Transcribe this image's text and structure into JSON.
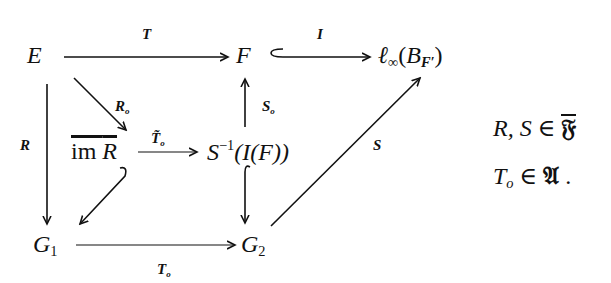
{
  "diagram": {
    "type": "commutative-diagram",
    "nodes": {
      "E": "E",
      "F": "F",
      "linf": "ℓ",
      "linf_sub": "∞",
      "linf_arg_open": "(",
      "linf_B": "B",
      "linf_B_sub": "F′",
      "linf_arg_close": ")",
      "imR_prefix": "im ",
      "imR_R": "R",
      "Sinv_S": "S",
      "Sinv_sup": "−1",
      "Sinv_rest": "(I(F))",
      "G1": "G",
      "G1_sub": "1",
      "G2": "G",
      "G2_sub": "2"
    },
    "arrows": [
      {
        "from": "E",
        "to": "F",
        "label": "T",
        "style": "arrow"
      },
      {
        "from": "F",
        "to": "ℓ∞(B_F′)",
        "label": "I",
        "style": "hook-arrow"
      },
      {
        "from": "E",
        "to": "G1",
        "label": "R",
        "style": "arrow"
      },
      {
        "from": "E",
        "to": "im R",
        "label": "R_o",
        "style": "arrow"
      },
      {
        "from": "im R",
        "to": "S⁻¹(I(F))",
        "label": "T̃_o",
        "style": "arrow"
      },
      {
        "from": "im R",
        "to": "G1",
        "label": "",
        "style": "hook-arrow"
      },
      {
        "from": "S⁻¹(I(F))",
        "to": "F",
        "label": "S_o",
        "style": "arrow"
      },
      {
        "from": "S⁻¹(I(F))",
        "to": "G2",
        "label": "",
        "style": "hook-arrow"
      },
      {
        "from": "G1",
        "to": "G2",
        "label": "T_o",
        "style": "arrow"
      },
      {
        "from": "G2",
        "to": "ℓ∞(B_F′)",
        "label": "S",
        "style": "arrow"
      }
    ],
    "labels": {
      "T": "T",
      "I": "I",
      "R": "R",
      "Ro": "R",
      "Ro_sub": "o",
      "Tto": "T̃",
      "Tto_sub": "o",
      "So": "S",
      "So_sub": "o",
      "To": "T",
      "To_sub": "o",
      "S": "S"
    }
  },
  "side_conditions": {
    "line1_vars": "R, S",
    "line1_rel": " ∈ ",
    "line1_set": "𝔉",
    "line2_var": "T",
    "line2_var_sub": "o",
    "line2_rel": " ∈ ",
    "line2_set": "𝔄",
    "line2_end": " ."
  }
}
